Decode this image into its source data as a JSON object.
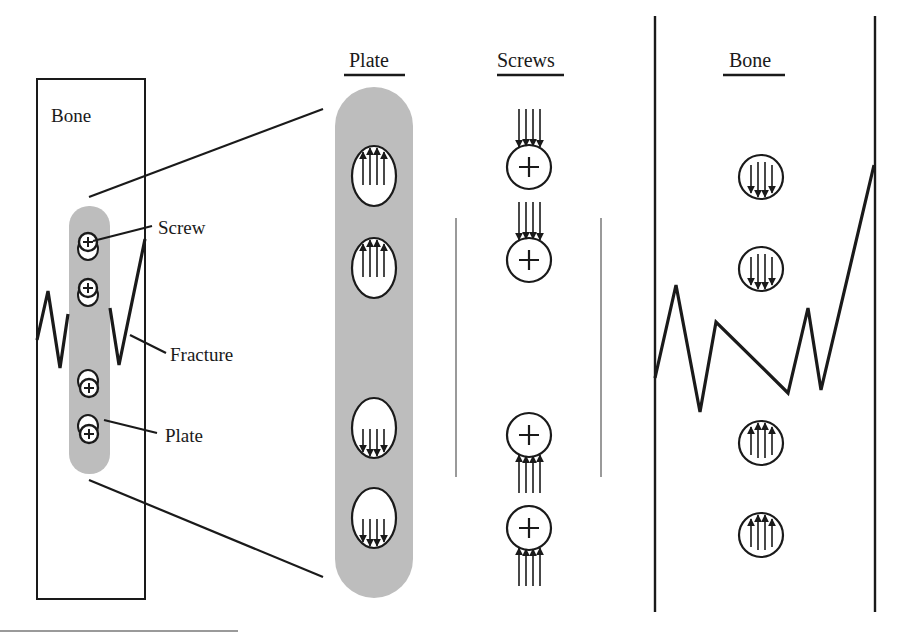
{
  "figure": {
    "overview": {
      "bone_label": "Bone",
      "callouts": {
        "screw": "Screw",
        "fracture": "Fracture",
        "plate": "Plate"
      }
    },
    "detail_columns": {
      "plate_header": "Plate",
      "screws_header": "Screws",
      "bone_header": "Bone"
    },
    "colors": {
      "plate_fill": "#bdbdbd",
      "stroke": "#1a1a1a",
      "divider": "#9a9a9a",
      "background": "#ffffff"
    },
    "force_arrows": {
      "plate_holes": [
        "up",
        "up",
        "down",
        "down"
      ],
      "screws": [
        "down",
        "down",
        "up",
        "up"
      ],
      "bone_holes": [
        "down",
        "down",
        "up",
        "up"
      ]
    }
  }
}
